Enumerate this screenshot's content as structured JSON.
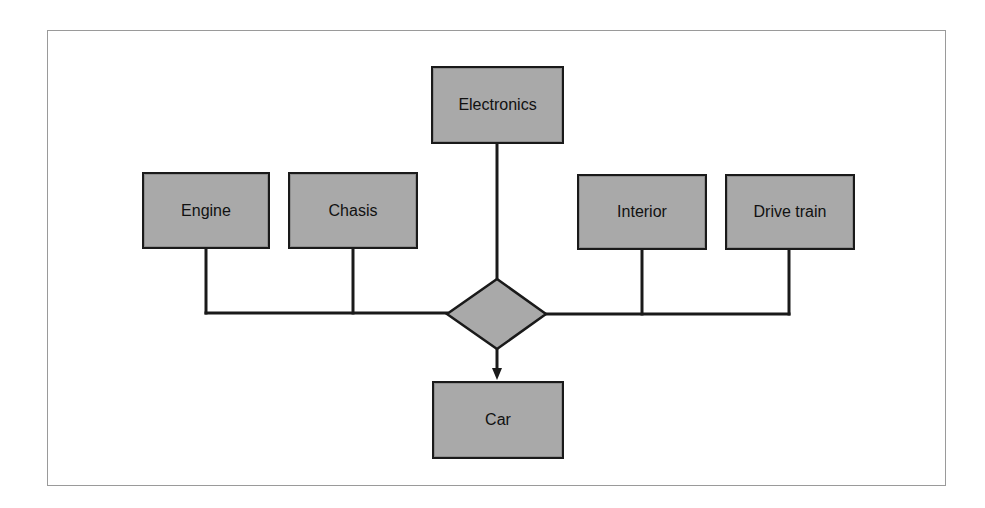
{
  "diagram": {
    "type": "assembly-flow",
    "colors": {
      "box_fill": "#a9a9a9",
      "stroke": "#1a1a1a",
      "frame": "#9a9a9a",
      "background": "#ffffff"
    },
    "nodes": {
      "electronics": {
        "label": "Electronics"
      },
      "engine": {
        "label": "Engine"
      },
      "chasis": {
        "label": "Chasis"
      },
      "interior": {
        "label": "Interior"
      },
      "drive_train": {
        "label": "Drive train"
      },
      "car": {
        "label": "Car"
      }
    },
    "junction": {
      "shape": "diamond"
    },
    "edges": [
      {
        "from": "Electronics",
        "to": "junction"
      },
      {
        "from": "Engine",
        "to": "junction"
      },
      {
        "from": "Chasis",
        "to": "junction"
      },
      {
        "from": "Interior",
        "to": "junction"
      },
      {
        "from": "Drive train",
        "to": "junction"
      },
      {
        "from": "junction",
        "to": "Car",
        "arrow": true
      }
    ]
  }
}
